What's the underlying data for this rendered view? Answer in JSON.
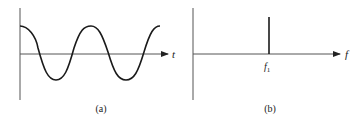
{
  "panels": [
    {
      "id": "a",
      "caption": "(a)",
      "x_axis_label": "t",
      "description": "Time-domain sinusoid (cosine) over two periods",
      "signal": "cosine"
    },
    {
      "id": "b",
      "caption": "(b)",
      "x_axis_label": "f",
      "description": "Frequency-domain spectrum with single spectral line",
      "spike_label_base": "f",
      "spike_label_sub": "1"
    }
  ],
  "colors": {
    "axis": "#555555",
    "curve": "#1a1a1a",
    "background": "#ffffff"
  }
}
